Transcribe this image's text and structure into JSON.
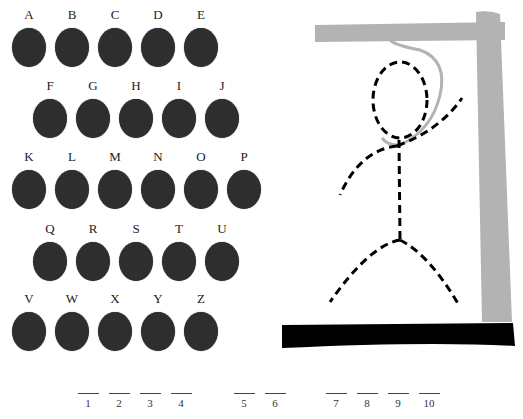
{
  "keyboard": {
    "rows": [
      [
        "A",
        "B",
        "C",
        "D",
        "E"
      ],
      [
        "F",
        "G",
        "H",
        "I",
        "J"
      ],
      [
        "K",
        "L",
        "M",
        "N",
        "O",
        "P"
      ],
      [
        "Q",
        "R",
        "S",
        "T",
        "U"
      ],
      [
        "V",
        "W",
        "X",
        "Y",
        "Z"
      ]
    ]
  },
  "hangman": {
    "parts_drawn": [
      "head",
      "body",
      "left-arm",
      "right-arm",
      "left-leg",
      "right-leg",
      "rope"
    ],
    "colors": {
      "gallows": "#b3b3b3",
      "base": "#000000",
      "figure": "#000000",
      "rope": "#b3b3b3"
    }
  },
  "word_slots": {
    "groups": [
      [
        "1",
        "2",
        "3",
        "4"
      ],
      [
        "5",
        "6"
      ],
      [
        "7",
        "8",
        "9",
        "10"
      ]
    ]
  }
}
